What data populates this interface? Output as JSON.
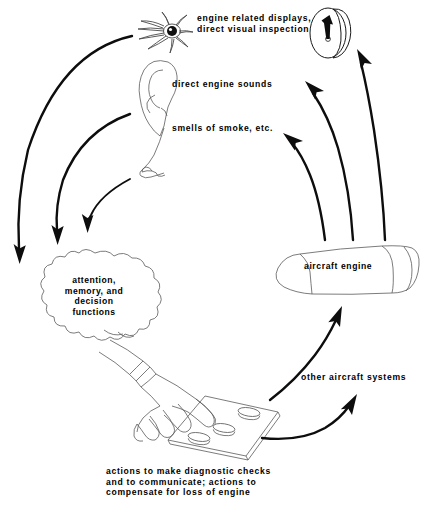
{
  "diagram": {
    "type": "flow-loop",
    "labels": {
      "eye": "engine related displays,\ndirect visual inspection",
      "ear": "direct engine sounds",
      "nose": "smells of smoke, etc.",
      "brain": "attention,\nmemory, and\ndecision\nfunctions",
      "engine": "aircraft engine",
      "other_systems": "other aircraft systems",
      "actions": "actions to make diagnostic checks\nand to communicate; actions to\ncompensate for loss of engine"
    },
    "nodes": [
      {
        "id": "eye",
        "name": "eye-illustration",
        "label": "engine related displays, direct visual inspection"
      },
      {
        "id": "ear",
        "name": "ear-illustration",
        "label": "direct engine sounds"
      },
      {
        "id": "nose",
        "name": "nose-illustration",
        "label": "smells of smoke, etc."
      },
      {
        "id": "gauge",
        "name": "engine-display-gauge",
        "label": ""
      },
      {
        "id": "brain",
        "name": "cognition-cloud",
        "label": "attention, memory, and decision functions"
      },
      {
        "id": "hand",
        "name": "hand-on-control-panel",
        "label": "actions to make diagnostic checks and to communicate; actions to compensate for loss of engine"
      },
      {
        "id": "engine",
        "name": "aircraft-engine-nacelle",
        "label": "aircraft engine"
      },
      {
        "id": "other",
        "name": "other-aircraft-systems-node",
        "label": "other aircraft systems"
      }
    ],
    "edges": [
      {
        "from": "eye",
        "to": "brain",
        "name": "arrow-eye-to-brain"
      },
      {
        "from": "ear",
        "to": "brain",
        "name": "arrow-ear-to-brain"
      },
      {
        "from": "nose",
        "to": "brain",
        "name": "arrow-nose-to-brain"
      },
      {
        "from": "engine",
        "to": "gauge",
        "name": "arrow-engine-to-display"
      },
      {
        "from": "engine",
        "to": "ear",
        "name": "arrow-engine-to-ear"
      },
      {
        "from": "engine",
        "to": "nose",
        "name": "arrow-engine-to-nose"
      },
      {
        "from": "hand",
        "to": "engine",
        "name": "arrow-actions-to-engine"
      },
      {
        "from": "hand",
        "to": "other",
        "name": "arrow-actions-to-other-systems"
      }
    ],
    "colors": {
      "ink": "#0d0d0d",
      "line": "#5a5a5a",
      "background": "#ffffff"
    },
    "panel": {
      "name": "control-panel",
      "button_count": 3
    }
  }
}
